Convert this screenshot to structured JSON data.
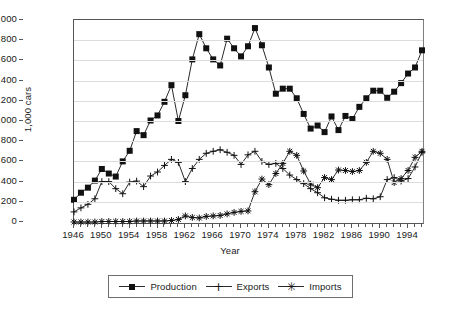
{
  "chart_data": {
    "type": "line",
    "title": "",
    "xlabel": "Year",
    "ylabel": "1,000 cars",
    "xlim": [
      1946,
      1996
    ],
    "ylim": [
      0,
      2000
    ],
    "ytick_step": 200,
    "ytick_labels": [
      "0",
      "200",
      "400",
      "600",
      "800",
      "1,000",
      "1,200",
      "1,400",
      "1,600",
      "1,800",
      "2,000"
    ],
    "ytick_values": [
      0,
      200,
      400,
      600,
      800,
      1000,
      1200,
      1400,
      1600,
      1800,
      2000
    ],
    "xtick_labels": [
      "1946",
      "1950",
      "1954",
      "1958",
      "1962",
      "1966",
      "1970",
      "1974",
      "1978",
      "1982",
      "1986",
      "1990",
      "1994"
    ],
    "xtick_values": [
      1946,
      1950,
      1954,
      1958,
      1962,
      1966,
      1970,
      1974,
      1978,
      1982,
      1986,
      1990,
      1994
    ],
    "grid": true,
    "legend_position": "bottom",
    "x": [
      1946,
      1947,
      1948,
      1949,
      1950,
      1951,
      1952,
      1953,
      1954,
      1955,
      1956,
      1957,
      1958,
      1959,
      1960,
      1961,
      1962,
      1963,
      1964,
      1965,
      1966,
      1967,
      1968,
      1969,
      1970,
      1971,
      1972,
      1973,
      1974,
      1975,
      1976,
      1977,
      1978,
      1979,
      1980,
      1981,
      1982,
      1983,
      1984,
      1985,
      1986,
      1987,
      1988,
      1989,
      1990,
      1991,
      1992,
      1993,
      1994,
      1995,
      1996
    ],
    "series": [
      {
        "name": "Production",
        "marker": "square",
        "values": [
          220,
          290,
          340,
          410,
          525,
          480,
          450,
          600,
          705,
          900,
          860,
          1005,
          1055,
          1190,
          1355,
          1000,
          1255,
          1610,
          1860,
          1720,
          1610,
          1550,
          1815,
          1720,
          1640,
          1740,
          1920,
          1750,
          1530,
          1270,
          1320,
          1320,
          1225,
          1070,
          925,
          955,
          890,
          1045,
          910,
          1050,
          1020,
          1140,
          1225,
          1300,
          1300,
          1230,
          1290,
          1375,
          1470,
          1530,
          1700
        ]
      },
      {
        "name": "Exports",
        "marker": "plus",
        "values": [
          100,
          140,
          175,
          230,
          400,
          400,
          330,
          280,
          395,
          405,
          350,
          455,
          495,
          560,
          620,
          590,
          400,
          530,
          620,
          680,
          700,
          715,
          690,
          660,
          570,
          665,
          700,
          600,
          570,
          580,
          530,
          465,
          420,
          380,
          330,
          290,
          240,
          225,
          215,
          215,
          220,
          220,
          235,
          230,
          250,
          420,
          440,
          405,
          430,
          545,
          690
        ]
      },
      {
        "name": "Imports",
        "marker": "star",
        "values": [
          0,
          0,
          0,
          0,
          5,
          5,
          5,
          5,
          5,
          10,
          10,
          10,
          10,
          10,
          15,
          25,
          60,
          45,
          40,
          55,
          60,
          65,
          80,
          95,
          105,
          110,
          300,
          425,
          370,
          480,
          580,
          700,
          660,
          505,
          375,
          340,
          440,
          420,
          515,
          510,
          500,
          510,
          590,
          700,
          680,
          620,
          390,
          430,
          510,
          640,
          700
        ]
      }
    ]
  },
  "axes": {
    "y_title": "1,000 cars",
    "x_title": "Year"
  },
  "legend": {
    "items": [
      {
        "label": "Production",
        "marker": "square-marker",
        "color": "#111111"
      },
      {
        "label": "Exports",
        "marker": "plus-marker",
        "color": "#111111"
      },
      {
        "label": "Imports",
        "marker": "asterisk-marker",
        "color": "#111111"
      }
    ]
  },
  "colors": {
    "line": "#2b2b2b",
    "axis": "#55565a",
    "grid": "#dcdcdc",
    "background": "#ffffff"
  }
}
